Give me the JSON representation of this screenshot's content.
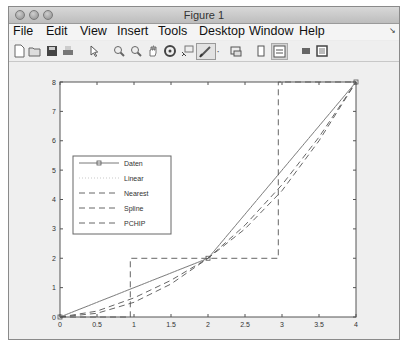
{
  "window": {
    "title": "Figure 1",
    "controls": [
      "close",
      "minimize",
      "zoom"
    ]
  },
  "menubar": {
    "items": [
      "File",
      "Edit",
      "View",
      "Insert",
      "Tools",
      "Desktop",
      "Window",
      "Help"
    ],
    "overflow_icon": "dock-arrow-icon"
  },
  "toolbar": {
    "buttons": [
      {
        "name": "new-figure-icon",
        "glyph": "🗋"
      },
      {
        "name": "open-file-icon",
        "glyph": "📂"
      },
      {
        "name": "save-icon",
        "glyph": "💾"
      },
      {
        "name": "print-icon",
        "glyph": "🖶"
      },
      {
        "name": "pointer-icon",
        "glyph": "↖"
      },
      {
        "name": "zoom-in-icon",
        "glyph": "🔍"
      },
      {
        "name": "zoom-out-icon",
        "glyph": "🔍"
      },
      {
        "name": "pan-icon",
        "glyph": "✋"
      },
      {
        "name": "rotate-3d-icon",
        "glyph": "⟳"
      },
      {
        "name": "data-cursor-icon",
        "glyph": "⌖"
      },
      {
        "name": "brush-icon",
        "glyph": "🖌"
      },
      {
        "name": "brush-dropdown-icon",
        "glyph": "▾"
      },
      {
        "name": "link-plot-icon",
        "glyph": "⧉"
      },
      {
        "name": "colorbar-icon",
        "glyph": "▯"
      },
      {
        "name": "legend-icon",
        "glyph": "☷"
      },
      {
        "name": "hide-plot-tools-icon",
        "glyph": "▪"
      },
      {
        "name": "show-plot-tools-icon",
        "glyph": "▣"
      }
    ]
  },
  "chart_data": {
    "type": "line",
    "title": "",
    "xlabel": "",
    "ylabel": "",
    "xlim": [
      0,
      4
    ],
    "ylim": [
      0,
      8
    ],
    "xticks": [
      "0",
      "0.5",
      "1",
      "1.5",
      "2",
      "2.5",
      "3",
      "3.5",
      "4"
    ],
    "yticks": [
      "0",
      "1",
      "2",
      "3",
      "4",
      "5",
      "6",
      "7",
      "8"
    ],
    "grid": false,
    "legend_position": "west",
    "series": [
      {
        "name": "Daten",
        "style": "solid-square-marker",
        "x": [
          0,
          2,
          4
        ],
        "y": [
          0,
          2,
          8
        ]
      },
      {
        "name": "Linear",
        "style": "dotted",
        "x": [
          0,
          2,
          4
        ],
        "y": [
          0,
          2,
          8
        ]
      },
      {
        "name": "Nearest",
        "style": "dashed",
        "x": [
          0,
          0.95,
          0.95,
          1.0,
          2.95,
          2.95,
          3.0,
          4
        ],
        "y": [
          0,
          0,
          2,
          2,
          2,
          8,
          8,
          8
        ]
      },
      {
        "name": "Spline",
        "style": "dashed",
        "x": [
          0,
          0.5,
          1,
          1.5,
          2,
          2.5,
          3,
          3.5,
          4
        ],
        "y": [
          0,
          0.125,
          0.5,
          1.125,
          2,
          3.125,
          4.5,
          6.125,
          8
        ]
      },
      {
        "name": "PCHIP",
        "style": "dashed",
        "x": [
          0,
          0.5,
          1,
          1.5,
          2,
          2.5,
          3,
          3.5,
          4
        ],
        "y": [
          0,
          0.2,
          0.65,
          1.25,
          2,
          3.0,
          4.3,
          6.0,
          8
        ]
      }
    ]
  }
}
